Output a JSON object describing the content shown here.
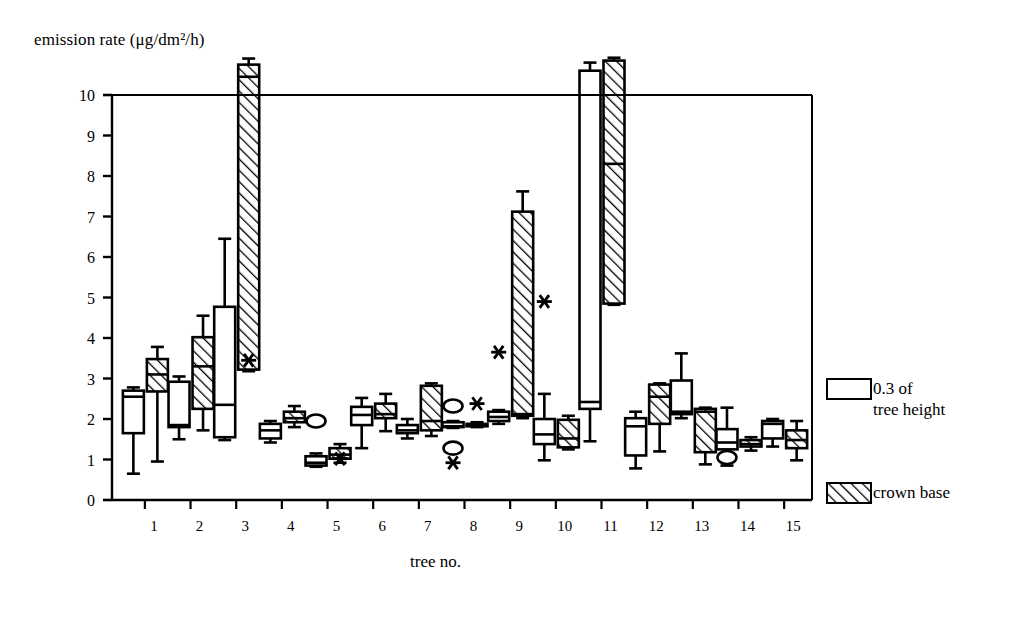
{
  "chart_data": {
    "type": "box",
    "title": "",
    "ylabel": "emission rate (μg/dm²/h)",
    "xlabel": "tree no.",
    "ylim": [
      0,
      10
    ],
    "yticks": [
      0,
      1,
      2,
      3,
      4,
      5,
      6,
      7,
      8,
      9,
      10
    ],
    "ytick_labels": [
      "0",
      "1",
      "2",
      "3",
      "4",
      "5",
      "6",
      "7",
      "8",
      "9",
      "10"
    ],
    "categories": [
      "1",
      "2",
      "3",
      "4",
      "5",
      "6",
      "7",
      "8",
      "9",
      "10",
      "11",
      "12",
      "13",
      "14",
      "15"
    ],
    "grid": false,
    "legend_position": "right",
    "series": [
      {
        "name": "0.3 of tree height",
        "fill": "white",
        "boxes": [
          {
            "category": "1",
            "whisker_low": 0.65,
            "q1": 1.65,
            "median": 2.55,
            "q3": 2.7,
            "whisker_high": 2.78,
            "outliers": [],
            "extremes": []
          },
          {
            "category": "2",
            "whisker_low": 1.5,
            "q1": 1.8,
            "median": 1.85,
            "q3": 2.92,
            "whisker_high": 3.05,
            "outliers": [],
            "extremes": []
          },
          {
            "category": "3",
            "whisker_low": 1.48,
            "q1": 1.55,
            "median": 2.35,
            "q3": 4.77,
            "whisker_high": 6.45,
            "outliers": [],
            "extremes": []
          },
          {
            "category": "4",
            "whisker_low": 1.42,
            "q1": 1.52,
            "median": 1.72,
            "q3": 1.88,
            "whisker_high": 1.95,
            "outliers": [],
            "extremes": []
          },
          {
            "category": "5",
            "whisker_low": 0.82,
            "q1": 0.85,
            "median": 0.92,
            "q3": 1.08,
            "whisker_high": 1.15,
            "outliers": [
              1.95
            ],
            "extremes": []
          },
          {
            "category": "6",
            "whisker_low": 1.28,
            "q1": 1.85,
            "median": 2.1,
            "q3": 2.3,
            "whisker_high": 2.52,
            "outliers": [],
            "extremes": []
          },
          {
            "category": "7",
            "whisker_low": 1.52,
            "q1": 1.65,
            "median": 1.72,
            "q3": 1.85,
            "whisker_high": 2.0,
            "outliers": [],
            "extremes": []
          },
          {
            "category": "8",
            "whisker_low": 1.78,
            "q1": 1.8,
            "median": 1.82,
            "q3": 1.92,
            "whisker_high": 1.95,
            "outliers": [
              2.32,
              1.28
            ],
            "extremes": [
              0.92
            ]
          },
          {
            "category": "9",
            "whisker_low": 1.88,
            "q1": 1.95,
            "median": 2.05,
            "q3": 2.18,
            "whisker_high": 2.22,
            "outliers": [],
            "extremes": [
              3.65
            ]
          },
          {
            "category": "10",
            "whisker_low": 0.98,
            "q1": 1.38,
            "median": 1.62,
            "q3": 2.0,
            "whisker_high": 2.62,
            "outliers": [],
            "extremes": [
              4.9
            ]
          },
          {
            "category": "11",
            "whisker_low": 1.45,
            "q1": 2.25,
            "median": 2.42,
            "q3": 10.6,
            "whisker_high": 10.8,
            "outliers": [],
            "extremes": []
          },
          {
            "category": "12",
            "whisker_low": 0.78,
            "q1": 1.1,
            "median": 1.82,
            "q3": 2.02,
            "whisker_high": 2.18,
            "outliers": [],
            "extremes": []
          },
          {
            "category": "13",
            "whisker_low": 2.02,
            "q1": 2.12,
            "median": 2.18,
            "q3": 2.95,
            "whisker_high": 3.62,
            "outliers": [],
            "extremes": []
          },
          {
            "category": "14",
            "whisker_low": 0.85,
            "q1": 1.25,
            "median": 1.42,
            "q3": 1.75,
            "whisker_high": 2.28,
            "outliers": [
              1.05
            ],
            "extremes": []
          },
          {
            "category": "15",
            "whisker_low": 1.32,
            "q1": 1.52,
            "median": 1.88,
            "q3": 1.95,
            "whisker_high": 2.0,
            "outliers": [],
            "extremes": []
          }
        ]
      },
      {
        "name": "crown base",
        "fill": "hatched",
        "boxes": [
          {
            "category": "1",
            "whisker_low": 0.95,
            "q1": 2.68,
            "median": 3.1,
            "q3": 3.48,
            "whisker_high": 3.78,
            "outliers": [],
            "extremes": []
          },
          {
            "category": "2",
            "whisker_low": 1.72,
            "q1": 2.25,
            "median": 3.3,
            "q3": 4.02,
            "whisker_high": 4.55,
            "outliers": [],
            "extremes": []
          },
          {
            "category": "3",
            "whisker_low": 3.18,
            "q1": 3.22,
            "median": 10.45,
            "q3": 10.75,
            "whisker_high": 10.9,
            "outliers": [],
            "extremes": [
              3.45
            ]
          },
          {
            "category": "4",
            "whisker_low": 1.8,
            "q1": 1.92,
            "median": 2.02,
            "q3": 2.18,
            "whisker_high": 2.32,
            "outliers": [],
            "extremes": []
          },
          {
            "category": "5",
            "whisker_low": 0.92,
            "q1": 1.02,
            "median": 1.12,
            "q3": 1.28,
            "whisker_high": 1.38,
            "outliers": [],
            "extremes": [
              1.02
            ]
          },
          {
            "category": "6",
            "whisker_low": 1.7,
            "q1": 2.02,
            "median": 2.12,
            "q3": 2.38,
            "whisker_high": 2.62,
            "outliers": [],
            "extremes": []
          },
          {
            "category": "7",
            "whisker_low": 1.58,
            "q1": 1.72,
            "median": 1.95,
            "q3": 2.82,
            "whisker_high": 2.88,
            "outliers": [],
            "extremes": []
          },
          {
            "category": "8",
            "whisker_low": 1.8,
            "q1": 1.82,
            "median": 1.85,
            "q3": 1.88,
            "whisker_high": 1.92,
            "outliers": [],
            "extremes": [
              2.38
            ]
          },
          {
            "category": "9",
            "whisker_low": 2.02,
            "q1": 2.08,
            "median": 2.12,
            "q3": 7.12,
            "whisker_high": 7.62,
            "outliers": [],
            "extremes": []
          },
          {
            "category": "10",
            "whisker_low": 1.25,
            "q1": 1.3,
            "median": 1.52,
            "q3": 1.98,
            "whisker_high": 2.08,
            "outliers": [],
            "extremes": []
          },
          {
            "category": "11",
            "whisker_low": 4.82,
            "q1": 4.85,
            "median": 8.3,
            "q3": 10.85,
            "whisker_high": 10.92,
            "outliers": [],
            "extremes": []
          },
          {
            "category": "12",
            "whisker_low": 1.2,
            "q1": 1.88,
            "median": 2.55,
            "q3": 2.85,
            "whisker_high": 2.88,
            "outliers": [],
            "extremes": []
          },
          {
            "category": "13",
            "whisker_low": 0.88,
            "q1": 1.18,
            "median": 2.18,
            "q3": 2.25,
            "whisker_high": 2.28,
            "outliers": [],
            "extremes": []
          },
          {
            "category": "14",
            "whisker_low": 1.22,
            "q1": 1.32,
            "median": 1.38,
            "q3": 1.48,
            "whisker_high": 1.55,
            "outliers": [],
            "extremes": []
          },
          {
            "category": "15",
            "whisker_low": 0.98,
            "q1": 1.28,
            "median": 1.48,
            "q3": 1.72,
            "whisker_high": 1.95,
            "outliers": [],
            "extremes": []
          }
        ]
      }
    ]
  },
  "axes": {
    "y_label": "emission rate (μg/dm²/h)",
    "x_label": "tree no.",
    "y_tick_labels": [
      "10",
      "9",
      "8",
      "7",
      "6",
      "5",
      "4",
      "3",
      "2",
      "1",
      "0"
    ],
    "x_tick_labels": [
      "1",
      "2",
      "3",
      "4",
      "5",
      "6",
      "7",
      "8",
      "9",
      "10",
      "11",
      "12",
      "13",
      "14",
      "15"
    ]
  },
  "legend": {
    "items": [
      {
        "label": "0.3 of\ntree height",
        "fill": "white"
      },
      {
        "label": "crown base",
        "fill": "hatched"
      }
    ]
  },
  "colors": {
    "stroke": "#000000",
    "background": "#ffffff"
  }
}
